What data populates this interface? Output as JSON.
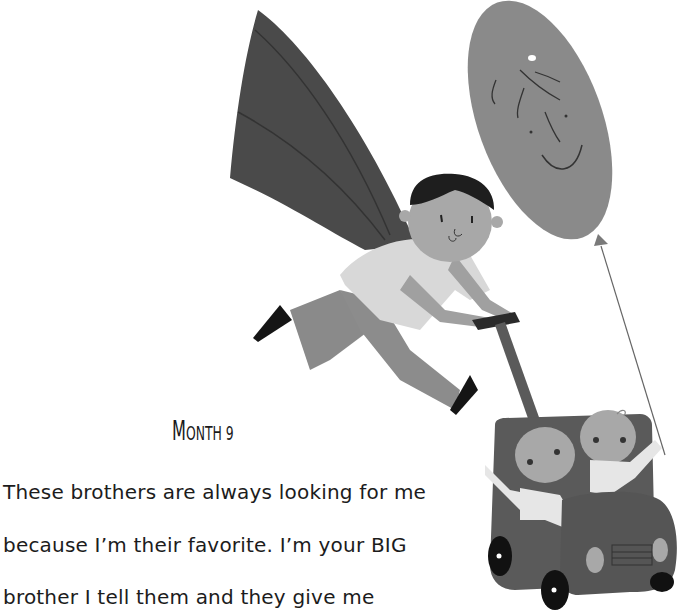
{
  "page": {
    "title_first": "M",
    "title_rest": "ONTH 9",
    "title_full": "Month 9",
    "body_lines": [
      "These brothers are always looking for me",
      "because I’m their favorite. I’m your BIG",
      "brother I tell them and they give me"
    ]
  },
  "illustration": {
    "description": "Winged boy flying while pushing a toy car stroller with two baby twins, a smiling balloon tied to the car",
    "colors": {
      "wing": "#4a4a4a",
      "balloon": "#8a8a8a",
      "skin": "#a8a8a8",
      "hair": "#1e1e1e",
      "shirt": "#d8d8d8",
      "pants": "#8c8c8c",
      "shoes": "#151515",
      "car": "#5a5a5a",
      "wheels": "#111111",
      "baby_clothes": "#e6e6e6"
    }
  }
}
